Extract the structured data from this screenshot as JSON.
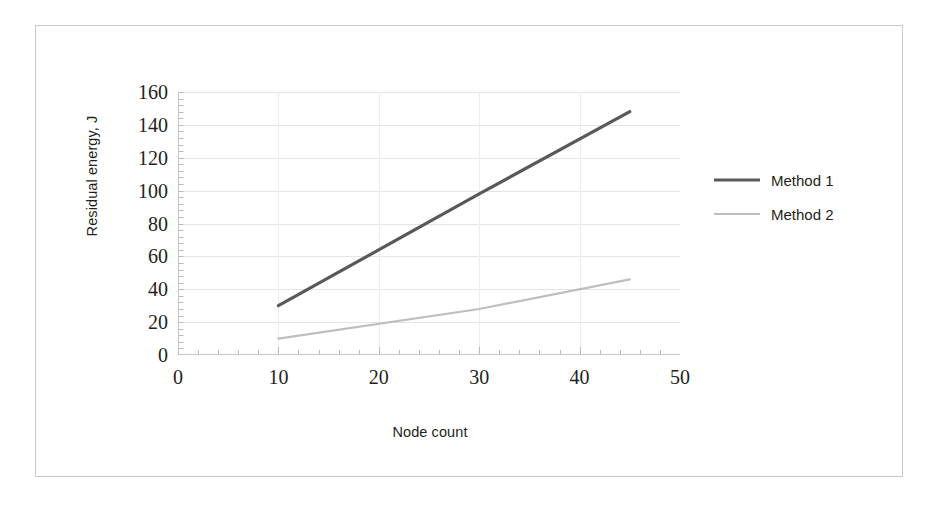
{
  "chart_data": {
    "type": "line",
    "title": "",
    "xlabel": "Node count",
    "ylabel": "Residual energy, J",
    "xlim": [
      0,
      50
    ],
    "ylim": [
      0,
      160
    ],
    "x_ticks": [
      0,
      10,
      20,
      30,
      40,
      50
    ],
    "y_ticks": [
      0,
      20,
      40,
      60,
      80,
      100,
      120,
      140,
      160
    ],
    "grid": "horizontal-major-faint",
    "legend_position": "right",
    "x": [
      10,
      30,
      45
    ],
    "series": [
      {
        "name": "Method 1",
        "color": "#58595b",
        "width": 3.2,
        "values": [
          30,
          98,
          148
        ]
      },
      {
        "name": "Method 2",
        "color": "#bcbec0",
        "width": 2.2,
        "values": [
          10,
          28,
          46
        ]
      }
    ]
  },
  "axes": {
    "y": {
      "title": "Residual energy, J",
      "tick_labels": [
        "160",
        "140",
        "120",
        "100",
        "80",
        "60",
        "40",
        "20",
        "0"
      ]
    },
    "x": {
      "title": "Node count",
      "tick_labels": [
        "0",
        "10",
        "20",
        "30",
        "40",
        "50"
      ]
    }
  },
  "legend": {
    "items": [
      {
        "label": "Method 1",
        "color": "#58595b",
        "thickness": "3px"
      },
      {
        "label": "Method 2",
        "color": "#bcbec0",
        "thickness": "2px"
      }
    ]
  },
  "colors": {
    "frame": "#c9cacb",
    "axis": "#c4c5c7",
    "grid": "#e3e4e5",
    "text": "#231f20",
    "series_1": "#58595b",
    "series_2": "#bcbec0"
  }
}
